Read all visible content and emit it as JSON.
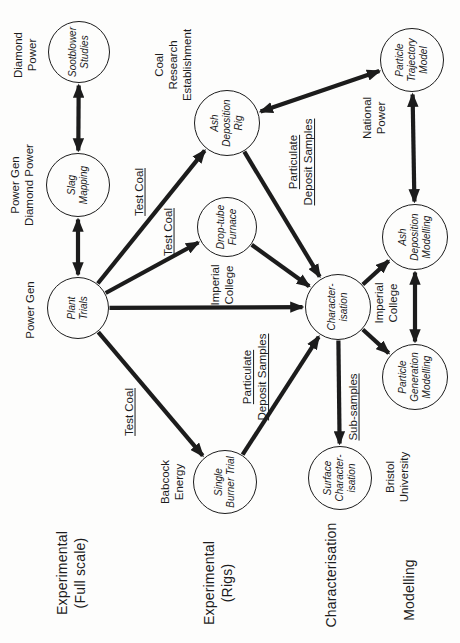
{
  "page": {
    "background": "#fdfdfc",
    "ink": "#1c1c1c",
    "width": 460,
    "height": 643
  },
  "diagram": {
    "type": "flow-diagram",
    "orientation": "landscape diagram rotated 90 degrees counter-clockwise on the page",
    "row_headers": [
      {
        "id": "experimental-full-scale",
        "label": "Experimental\n(Full scale)",
        "x": 70,
        "y": 71
      },
      {
        "id": "experimental-rigs",
        "label": "Experimental\n(Rigs)",
        "x": 60,
        "y": 218
      },
      {
        "id": "characterisation",
        "label": "Characterisation",
        "x": 68,
        "y": 331
      },
      {
        "id": "modelling",
        "label": "Modelling",
        "x": 53,
        "y": 409
      }
    ],
    "nodes": [
      {
        "id": "plant-trials",
        "label": "Plant\nTrials",
        "x": 335,
        "y": 78,
        "r": 31
      },
      {
        "id": "slag-mapping",
        "label": "Slag\nMapping",
        "x": 458,
        "y": 78,
        "r": 32
      },
      {
        "id": "sootblower-studies",
        "label": "Sootblower\nStudies",
        "x": 591,
        "y": 79,
        "r": 31
      },
      {
        "id": "single-burner-trial",
        "label": "Single\nBurner Trial",
        "x": 161,
        "y": 225,
        "r": 32
      },
      {
        "id": "drop-tube-furnace",
        "label": "Drop-tube\nFurnace",
        "x": 416,
        "y": 227,
        "r": 30
      },
      {
        "id": "ash-deposition-rig",
        "label": "Ash\nDeposition\nRig",
        "x": 520,
        "y": 227,
        "r": 33
      },
      {
        "id": "surface-characterisation",
        "label": "Surface\nCharacter-\nisation",
        "x": 165,
        "y": 340,
        "r": 32
      },
      {
        "id": "characterisation-node",
        "label": "Character-\nisation",
        "x": 336,
        "y": 338,
        "r": 33
      },
      {
        "id": "particle-generation-modelling",
        "label": "Particle\nGeneration\nModelling",
        "x": 266,
        "y": 415,
        "r": 33
      },
      {
        "id": "ash-deposition-modelling",
        "label": "Ash\nDeposition\nModelling",
        "x": 406,
        "y": 415,
        "r": 33
      },
      {
        "id": "particle-trajectory-model",
        "label": "Particle\nTrajectory\nModel",
        "x": 583,
        "y": 412,
        "r": 32
      }
    ],
    "org_labels": [
      {
        "id": "power-gen",
        "label": "Power Gen",
        "x": 333,
        "y": 30
      },
      {
        "id": "power-gen-diamond-power",
        "label": "Power Gen\nDiamond Power",
        "x": 458,
        "y": 22
      },
      {
        "id": "diamond-power",
        "label": "Diamond Power",
        "x": 588,
        "y": 25
      },
      {
        "id": "coal-research-establishment",
        "label": "Coal Research\nEstablishment",
        "x": 578,
        "y": 173
      },
      {
        "id": "imperial-college-furnace",
        "label": "Imperial\nCollege",
        "x": 358,
        "y": 222
      },
      {
        "id": "babcock-energy",
        "label": "Babcock\nEnergy",
        "x": 161,
        "y": 172
      },
      {
        "id": "bristol-university",
        "label": "Bristol\nUniversity",
        "x": 166,
        "y": 397
      },
      {
        "id": "imperial-college-characterisation",
        "label": "Imperial\nCollege",
        "x": 340,
        "y": 386
      },
      {
        "id": "national-power",
        "label": "National\nPower",
        "x": 525,
        "y": 374
      }
    ],
    "edge_labels": [
      {
        "id": "test-coal-rig",
        "edge": "plant-ashrig",
        "label": "Test Coal",
        "x": 451,
        "y": 139
      },
      {
        "id": "test-coal-furnace",
        "edge": "plant-droptube",
        "label": "Test Coal",
        "x": 411,
        "y": 168
      },
      {
        "id": "test-coal-burner",
        "edge": "plant-burner",
        "label": "Test Coal",
        "x": 231,
        "y": 129
      },
      {
        "id": "pds-rig",
        "edge": "ashrig-charac",
        "label": "Particulate\nDeposit Samples",
        "x": 481,
        "y": 301
      },
      {
        "id": "pds-burner",
        "edge": "burner-charac",
        "label": "Particulate\nDeposit Samples",
        "x": 266,
        "y": 255
      },
      {
        "id": "sub-samples",
        "edge": "charac-surface",
        "label": "Sub-samples",
        "x": 236,
        "y": 353
      }
    ],
    "arrows": [
      {
        "id": "plant-slag",
        "from": "plant-trials",
        "to": "slag-mapping",
        "double": true
      },
      {
        "id": "slag-sootblower",
        "from": "slag-mapping",
        "to": "sootblower-studies",
        "double": true
      },
      {
        "id": "plant-ashrig",
        "from": "plant-trials",
        "to": "ash-deposition-rig",
        "double": false
      },
      {
        "id": "plant-droptube",
        "from": "plant-trials",
        "to": "drop-tube-furnace",
        "double": false
      },
      {
        "id": "plant-burner",
        "from": "plant-trials",
        "to": "single-burner-trial",
        "double": false
      },
      {
        "id": "plant-charac",
        "from": "plant-trials",
        "to": "characterisation-node",
        "double": false
      },
      {
        "id": "ashrig-ptm",
        "from": "ash-deposition-rig",
        "to": "particle-trajectory-model",
        "double": true
      },
      {
        "id": "ashrig-charac",
        "from": "ash-deposition-rig",
        "to": "characterisation-node",
        "double": false
      },
      {
        "id": "droptube-charac",
        "from": "drop-tube-furnace",
        "to": "characterisation-node",
        "double": false
      },
      {
        "id": "burner-charac",
        "from": "single-burner-trial",
        "to": "characterisation-node",
        "double": false
      },
      {
        "id": "charac-surface",
        "from": "characterisation-node",
        "to": "surface-characterisation",
        "double": false
      },
      {
        "id": "charac-adm",
        "from": "characterisation-node",
        "to": "ash-deposition-modelling",
        "double": false
      },
      {
        "id": "charac-pgm",
        "from": "characterisation-node",
        "to": "particle-generation-modelling",
        "double": false
      },
      {
        "id": "ptm-adm",
        "from": "particle-trajectory-model",
        "to": "ash-deposition-modelling",
        "double": true
      },
      {
        "id": "adm-pgm",
        "from": "ash-deposition-modelling",
        "to": "particle-generation-modelling",
        "double": true
      }
    ]
  }
}
